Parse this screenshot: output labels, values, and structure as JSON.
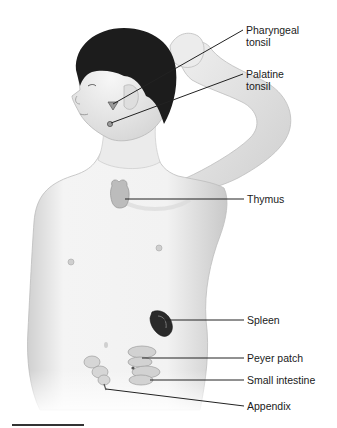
{
  "diagram": {
    "labels": [
      {
        "id": "pharyngeal-tonsil",
        "line1": "Pharyngeal",
        "line2": "tonsil"
      },
      {
        "id": "palatine-tonsil",
        "line1": "Palatine",
        "line2": "tonsil"
      },
      {
        "id": "thymus",
        "line1": "Thymus"
      },
      {
        "id": "spleen",
        "line1": "Spleen"
      },
      {
        "id": "peyer-patch",
        "line1": "Peyer patch"
      },
      {
        "id": "small-intestine",
        "line1": "Small intestine"
      },
      {
        "id": "appendix",
        "line1": "Appendix"
      }
    ],
    "colors": {
      "background": "#ffffff",
      "skin": "#f0f0f0",
      "skin_shadow": "#c8c8c8",
      "hair": "#1c1c1c",
      "organ_gray": "#b5b5b5",
      "spleen": "#2a2a2a",
      "leader_line": "#222222",
      "text": "#1a1a1a"
    }
  }
}
